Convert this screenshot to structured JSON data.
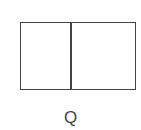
{
  "diagram": {
    "shape": "rectangle divided into two parts",
    "parts": 2,
    "label": "Q",
    "colors": {
      "stroke": "#444444",
      "fill": "#ffffff"
    }
  }
}
